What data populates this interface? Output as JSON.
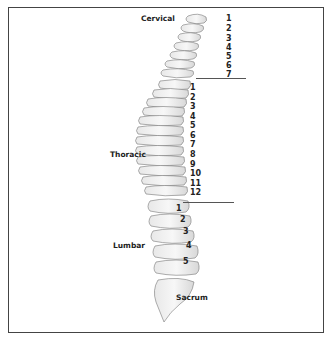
{
  "figure": {
    "regions": [
      {
        "name": "Cervical",
        "count": 7
      },
      {
        "name": "Thoracic",
        "count": 12
      },
      {
        "name": "Lumbar",
        "count": 5
      },
      {
        "name": "Sacrum"
      }
    ],
    "labels": {
      "cervical": "Cervical",
      "thoracic": "Thoracic",
      "lumbar": "Lumbar",
      "sacrum": "Sacrum"
    },
    "cervical_numbers": [
      "1",
      "2",
      "3",
      "4",
      "5",
      "6",
      "7"
    ],
    "thoracic_numbers": [
      "1",
      "2",
      "3",
      "4",
      "5",
      "6",
      "7",
      "8",
      "9",
      "10",
      "11",
      "12"
    ],
    "lumbar_numbers": [
      "1",
      "2",
      "3",
      "4",
      "5"
    ]
  }
}
